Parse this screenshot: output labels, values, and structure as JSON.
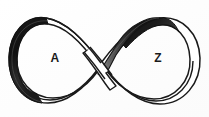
{
  "figure": {
    "name": "mobius-band-infinity-diagram",
    "width": 209,
    "height": 117,
    "background_color": "#ffffff",
    "outline_color": "#1a1a1a",
    "band_front_color": "#ffffff",
    "band_back_color": "#1c1c1c",
    "band_back_color_mid": "#4a4a4a",
    "band_back_color_light": "#8c8c8c",
    "labels": [
      {
        "id": "label-a",
        "text": "A",
        "x": 55,
        "y": 58,
        "loop": "left"
      },
      {
        "id": "label-z",
        "text": "Z",
        "x": 158,
        "y": 58,
        "loop": "right"
      }
    ],
    "crossing": {
      "x": 101,
      "y": 63
    }
  }
}
